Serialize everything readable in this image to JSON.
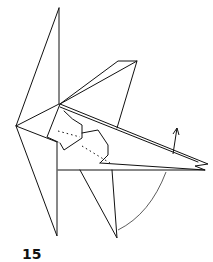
{
  "diagram": {
    "type": "origami-fold-step",
    "step_number": "15",
    "line_color": "#111111",
    "background": "#ffffff",
    "annotations": [
      {
        "kind": "arrow-up",
        "meaning": "fold up"
      },
      {
        "kind": "arc",
        "meaning": "swing motion"
      },
      {
        "kind": "dotted-line",
        "meaning": "hidden edge"
      }
    ]
  }
}
